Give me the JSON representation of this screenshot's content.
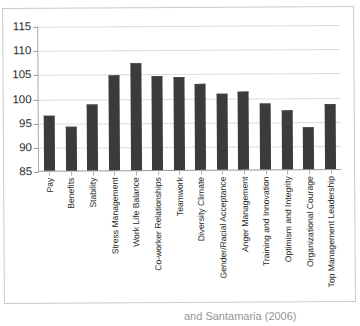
{
  "chart_data": {
    "type": "bar",
    "title": "",
    "subtitle": "",
    "xlabel": "",
    "ylabel": "",
    "ylim": [
      85,
      115
    ],
    "ytick_step": 5,
    "yticks": [
      115,
      110,
      105,
      100,
      95,
      90,
      85
    ],
    "grid": true,
    "legend": "none",
    "bar_color": "#3b3b3b",
    "categories": [
      "Pay",
      "Benefits",
      "Stability",
      "Stress Management",
      "Work Life Balance",
      "Co-worker Relationships",
      "Teamwork",
      "Diversity Climate",
      "Gender/Racial Acceptance",
      "Anger Management",
      "Training and Innovation",
      "Optimism and Integrity",
      "Organizational Courage",
      "Top Management Leadership"
    ],
    "values": [
      96.4,
      94.2,
      98.7,
      104.7,
      107.2,
      104.4,
      104.2,
      102.8,
      100.8,
      101.2,
      98.6,
      97.2,
      93.7,
      98.5
    ]
  },
  "caption": {
    "text": "and Santamaria (2006)"
  }
}
